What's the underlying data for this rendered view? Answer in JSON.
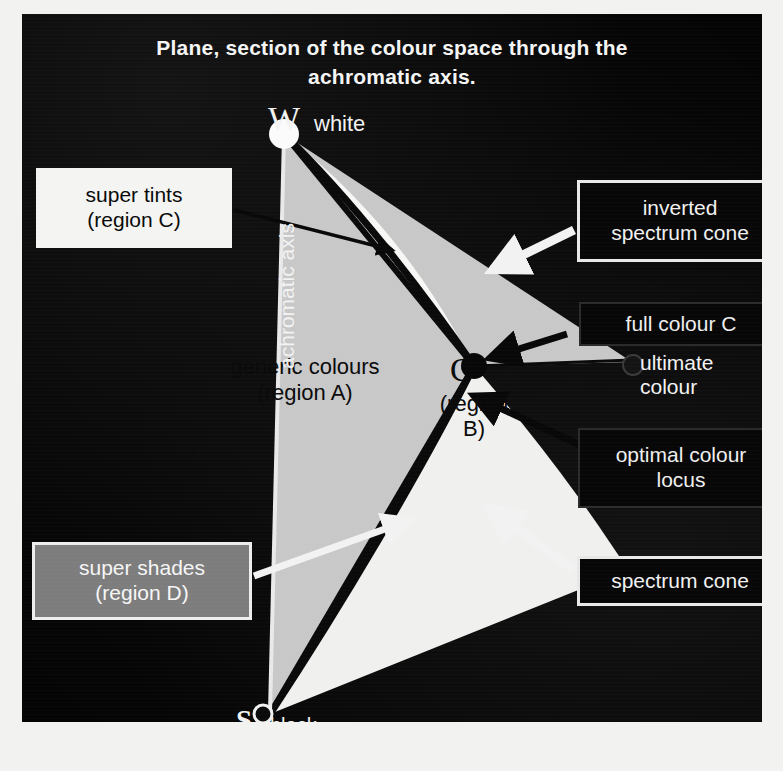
{
  "figure": {
    "title_line1": "Plane, section of the colour space  through the",
    "title_line2": "achromatic axis."
  },
  "vertices": {
    "white_symbol": "W",
    "white_label": "white",
    "black_symbol": "S",
    "black_label": "black",
    "full_colour_symbol": "C"
  },
  "axis": {
    "label": "achromatic axis"
  },
  "regions": {
    "a_line1": "generic colours",
    "a_line2": "(region A)",
    "b_line1": "(region",
    "b_line2": "B)",
    "c_line1": "super tints",
    "c_line2": "(region C)",
    "d_line1": "super shades",
    "d_line2": "(region D)"
  },
  "callouts": {
    "inverted_cone_line1": "inverted",
    "inverted_cone_line2": "spectrum cone",
    "full_colour": "full colour C",
    "ultimate_colour": "ultimate colour",
    "optimal_locus_line1": "optimal colour",
    "optimal_locus_line2": "locus",
    "spectrum_cone": "spectrum cone"
  },
  "colors": {
    "panel_background": "#060606",
    "region_a_fill": "#c8c8c8",
    "region_b_fill": "#f0f0ee",
    "region_c_fill": "#f7f7f5",
    "region_d_fill": "#808080",
    "curve_stroke": "#0a0a0a",
    "white_arrow": "#f2f2f2",
    "black_arrow": "#080808",
    "label_text_light": "#f2f2f2",
    "label_text_dark": "#0a0a0a",
    "gray_box_fill": "#7d7d7d"
  },
  "geometry": {
    "point_W": [
      262,
      120
    ],
    "point_S": [
      248,
      700
    ],
    "point_C": [
      452,
      352
    ],
    "ultimate_colour_dot": [
      612,
      352
    ]
  }
}
